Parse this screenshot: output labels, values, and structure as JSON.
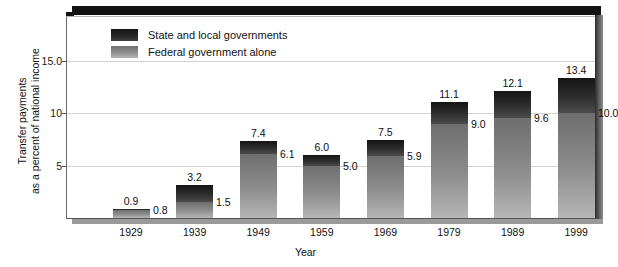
{
  "chart_data": {
    "type": "bar",
    "stacked": true,
    "title": "",
    "xlabel": "Year",
    "ylabel": "Transfer payments as a percent of national income",
    "ylabel_line1": "Transfer payments",
    "ylabel_line2": "as a percent of national income",
    "categories": [
      "1929",
      "1939",
      "1949",
      "1959",
      "1969",
      "1979",
      "1989",
      "1999"
    ],
    "ylim": [
      0,
      18
    ],
    "yticks": [
      "5",
      "10",
      "15.0"
    ],
    "ytick_values": [
      5,
      10,
      15
    ],
    "grid": true,
    "legend_position": "top-left",
    "series": [
      {
        "name": "State and local governments",
        "role": "total_minus_federal_upper_segment",
        "color": "#2e2e2e",
        "values": [
          0.1,
          1.7,
          1.3,
          1.0,
          1.6,
          2.1,
          2.5,
          3.4
        ]
      },
      {
        "name": "Federal government alone",
        "role": "lower_segment",
        "color": "#909090",
        "values": [
          0.8,
          1.5,
          6.1,
          5.0,
          5.9,
          9.0,
          9.6,
          10.0
        ]
      }
    ],
    "totals": [
      0.9,
      3.2,
      7.4,
      6.0,
      7.5,
      11.1,
      12.1,
      13.4
    ],
    "total_labels": [
      "0.9",
      "3.2",
      "7.4",
      "6.0",
      "7.5",
      "11.1",
      "12.1",
      "13.4"
    ],
    "federal_labels": [
      "0.8",
      "1.5",
      "6.1",
      "5.0",
      "5.9",
      "9.0",
      "9.6",
      "10.0"
    ]
  },
  "legend": {
    "items": [
      {
        "label": "State and local governments",
        "color": "#2e2e2e"
      },
      {
        "label": "Federal government alone",
        "color": "#909090"
      }
    ]
  },
  "axes": {
    "x_title": "Year",
    "y_title_line1": "Transfer payments",
    "y_title_line2": "as a percent of national income"
  }
}
